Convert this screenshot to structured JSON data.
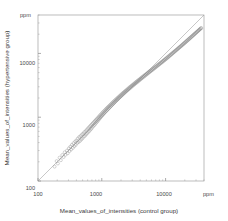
{
  "chart_data": {
    "type": "scatter",
    "title": "",
    "xlabel": "Mean_values_of_intensities (control group)",
    "ylabel": "Mean_values_of_intensities (hypertensive group)",
    "xscale": "log",
    "yscale": "log",
    "xlim": [
      100,
      40000
    ],
    "ylim": [
      100,
      40000
    ],
    "x_tick_labels": [
      "100",
      "1000",
      "10000"
    ],
    "x_tick_values": [
      100,
      1000,
      10000
    ],
    "y_tick_labels": [
      "100",
      "1000",
      "10000"
    ],
    "y_tick_values": [
      100,
      1000,
      10000
    ],
    "x_unit_label": "ppm",
    "y_unit_label": "ppm",
    "grid": false,
    "legend": "none",
    "marker": "open-circle",
    "marker_color": "#8c8c8c",
    "reference_line": {
      "name": "identity-line",
      "type": "y=x",
      "color": "#9a9a9a",
      "from": [
        100,
        100
      ],
      "to": [
        40000,
        40000
      ]
    },
    "series": [
      {
        "name": "genes",
        "points": [
          [
            182,
            168
          ],
          [
            196,
            205
          ],
          [
            205,
            188
          ],
          [
            218,
            232
          ],
          [
            228,
            212
          ],
          [
            240,
            255
          ],
          [
            252,
            238
          ],
          [
            262,
            282
          ],
          [
            270,
            258
          ],
          [
            285,
            300
          ],
          [
            292,
            272
          ],
          [
            305,
            325
          ],
          [
            312,
            295
          ],
          [
            322,
            345
          ],
          [
            330,
            312
          ],
          [
            340,
            368
          ],
          [
            352,
            330
          ],
          [
            360,
            392
          ],
          [
            372,
            352
          ],
          [
            382,
            415
          ],
          [
            390,
            368
          ],
          [
            400,
            432
          ],
          [
            412,
            395
          ],
          [
            420,
            462
          ],
          [
            432,
            408
          ],
          [
            442,
            488
          ],
          [
            455,
            425
          ],
          [
            465,
            508
          ],
          [
            478,
            448
          ],
          [
            488,
            535
          ],
          [
            498,
            468
          ],
          [
            510,
            552
          ],
          [
            522,
            495
          ],
          [
            532,
            582
          ],
          [
            545,
            512
          ],
          [
            558,
            605
          ],
          [
            568,
            538
          ],
          [
            580,
            632
          ],
          [
            592,
            562
          ],
          [
            605,
            665
          ],
          [
            618,
            588
          ],
          [
            630,
            692
          ],
          [
            642,
            615
          ],
          [
            655,
            722
          ],
          [
            668,
            645
          ],
          [
            680,
            752
          ],
          [
            692,
            668
          ],
          [
            705,
            782
          ],
          [
            718,
            705
          ],
          [
            730,
            812
          ],
          [
            745,
            735
          ],
          [
            758,
            845
          ],
          [
            772,
            762
          ],
          [
            785,
            878
          ],
          [
            798,
            798
          ],
          [
            812,
            912
          ],
          [
            825,
            832
          ],
          [
            840,
            945
          ],
          [
            855,
            862
          ],
          [
            870,
            982
          ],
          [
            885,
            902
          ],
          [
            900,
            1015
          ],
          [
            915,
            942
          ],
          [
            930,
            1058
          ],
          [
            945,
            978
          ],
          [
            962,
            1095
          ],
          [
            978,
            1018
          ],
          [
            995,
            1135
          ],
          [
            1010,
            1058
          ],
          [
            1028,
            1178
          ],
          [
            1045,
            1098
          ],
          [
            1062,
            1218
          ],
          [
            1080,
            1142
          ],
          [
            1098,
            1262
          ],
          [
            1115,
            1185
          ],
          [
            1135,
            1305
          ],
          [
            1152,
            1228
          ],
          [
            1172,
            1352
          ],
          [
            1192,
            1272
          ],
          [
            1212,
            1398
          ],
          [
            1232,
            1318
          ],
          [
            1252,
            1445
          ],
          [
            1275,
            1368
          ],
          [
            1295,
            1492
          ],
          [
            1318,
            1415
          ],
          [
            1340,
            1542
          ],
          [
            1362,
            1465
          ],
          [
            1385,
            1592
          ],
          [
            1408,
            1518
          ],
          [
            1432,
            1645
          ],
          [
            1458,
            1572
          ],
          [
            1482,
            1698
          ],
          [
            1508,
            1628
          ],
          [
            1532,
            1755
          ],
          [
            1558,
            1682
          ],
          [
            1585,
            1812
          ],
          [
            1612,
            1742
          ],
          [
            1640,
            1872
          ],
          [
            1668,
            1802
          ],
          [
            1698,
            1932
          ],
          [
            1728,
            1862
          ],
          [
            1758,
            1998
          ],
          [
            1788,
            1925
          ],
          [
            1820,
            2062
          ],
          [
            1852,
            1992
          ],
          [
            1885,
            2128
          ],
          [
            1918,
            2058
          ],
          [
            1952,
            2198
          ],
          [
            1988,
            2128
          ],
          [
            2022,
            2268
          ],
          [
            2058,
            2198
          ],
          [
            2095,
            2342
          ],
          [
            2132,
            2272
          ],
          [
            2172,
            2415
          ],
          [
            2210,
            2348
          ],
          [
            2250,
            2492
          ],
          [
            2292,
            2422
          ],
          [
            2332,
            2572
          ],
          [
            2375,
            2502
          ],
          [
            2418,
            2652
          ],
          [
            2462,
            2582
          ],
          [
            2508,
            2738
          ],
          [
            2552,
            2665
          ],
          [
            2600,
            2822
          ],
          [
            2648,
            2752
          ],
          [
            2698,
            2912
          ],
          [
            2748,
            2838
          ],
          [
            2798,
            3002
          ],
          [
            2852,
            2932
          ],
          [
            2905,
            3095
          ],
          [
            2958,
            3022
          ],
          [
            3015,
            3192
          ],
          [
            3072,
            3118
          ],
          [
            3130,
            3292
          ],
          [
            3188,
            3215
          ],
          [
            3248,
            3392
          ],
          [
            3310,
            3318
          ],
          [
            3372,
            3498
          ],
          [
            3435,
            3422
          ],
          [
            3500,
            3605
          ],
          [
            3568,
            3532
          ],
          [
            3635,
            3718
          ],
          [
            3705,
            3642
          ],
          [
            3775,
            3832
          ],
          [
            3848,
            3758
          ],
          [
            3920,
            3948
          ],
          [
            3995,
            3878
          ],
          [
            4072,
            4072
          ],
          [
            4150,
            3998
          ],
          [
            4230,
            4198
          ],
          [
            4312,
            4122
          ],
          [
            4395,
            4328
          ],
          [
            4480,
            4255
          ],
          [
            4568,
            4462
          ],
          [
            4655,
            4385
          ],
          [
            4748,
            4602
          ],
          [
            4840,
            4525
          ],
          [
            4935,
            4745
          ],
          [
            5032,
            4668
          ],
          [
            5132,
            4892
          ],
          [
            5232,
            4815
          ],
          [
            5338,
            5045
          ],
          [
            5442,
            4968
          ],
          [
            5552,
            5202
          ],
          [
            5662,
            5125
          ],
          [
            5778,
            5365
          ],
          [
            5892,
            5288
          ],
          [
            6012,
            5535
          ],
          [
            6132,
            5455
          ],
          [
            6258,
            5712
          ],
          [
            6382,
            5632
          ],
          [
            6515,
            5892
          ],
          [
            6645,
            5815
          ],
          [
            6782,
            6078
          ],
          [
            6920,
            6002
          ],
          [
            7062,
            6272
          ],
          [
            7205,
            6198
          ],
          [
            7355,
            6472
          ],
          [
            7502,
            6398
          ],
          [
            7658,
            6678
          ],
          [
            7812,
            6605
          ],
          [
            7975,
            6892
          ],
          [
            8135,
            6822
          ],
          [
            8305,
            7115
          ],
          [
            8472,
            7048
          ],
          [
            8648,
            7345
          ],
          [
            8822,
            7282
          ],
          [
            9005,
            7585
          ],
          [
            9185,
            7525
          ],
          [
            9378,
            7835
          ],
          [
            9565,
            7778
          ],
          [
            9765,
            8095
          ],
          [
            9962,
            8042
          ],
          [
            10170,
            8365
          ],
          [
            10375,
            8318
          ],
          [
            10592,
            8648
          ],
          [
            10805,
            8602
          ],
          [
            11030,
            8942
          ],
          [
            11252,
            8902
          ],
          [
            11485,
            9248
          ],
          [
            11718,
            9212
          ],
          [
            11962,
            9565
          ],
          [
            12202,
            9532
          ],
          [
            12455,
            9895
          ],
          [
            12705,
            9868
          ],
          [
            12968,
            10235
          ],
          [
            13228,
            10215
          ],
          [
            13502,
            10588
          ],
          [
            13772,
            10572
          ],
          [
            14058,
            10952
          ],
          [
            14338,
            10945
          ],
          [
            14635,
            11332
          ],
          [
            14925,
            11328
          ],
          [
            15232,
            11725
          ],
          [
            15535,
            11728
          ],
          [
            15855,
            12128
          ],
          [
            16168,
            12138
          ],
          [
            16500,
            12548
          ],
          [
            16825,
            12562
          ],
          [
            17168,
            12982
          ],
          [
            17505,
            13002
          ],
          [
            17862,
            13432
          ],
          [
            18212,
            13458
          ],
          [
            18582,
            13898
          ],
          [
            18945,
            13932
          ],
          [
            19328,
            14382
          ],
          [
            19702,
            14422
          ],
          [
            20098,
            14882
          ],
          [
            20485,
            14928
          ],
          [
            20898,
            15398
          ],
          [
            21302,
            15452
          ],
          [
            21728,
            15932
          ],
          [
            22145,
            15992
          ],
          [
            22588,
            16485
          ],
          [
            23022,
            16552
          ],
          [
            23482,
            17055
          ],
          [
            23932,
            17132
          ],
          [
            24408,
            17648
          ],
          [
            24875,
            17732
          ],
          [
            25368,
            18262
          ],
          [
            25852,
            18352
          ],
          [
            26362,
            18898
          ],
          [
            26865,
            18995
          ],
          [
            27395,
            19555
          ],
          [
            27912,
            19662
          ],
          [
            28462,
            20235
          ],
          [
            29000,
            20352
          ],
          [
            29568,
            20938
          ],
          [
            30125,
            21062
          ],
          [
            30712,
            21665
          ],
          [
            31288,
            21798
          ],
          [
            31895,
            22415
          ],
          [
            32492,
            22558
          ],
          [
            33118,
            23192
          ],
          [
            33732,
            23342
          ],
          [
            34382,
            23995
          ],
          [
            35018,
            24155
          ],
          [
            35688,
            24825
          ],
          [
            36345,
            24995
          ]
        ]
      }
    ],
    "n_points": 250,
    "correlation_note": "points distributed tightly along identity line"
  },
  "labels": {
    "x_axis_title": "Mean_values_of_intensities (control group)",
    "y_axis_title": "Mean_values_of_intensities (hypertensive group)",
    "top_left_unit": "ppm",
    "bottom_right_unit": "ppm",
    "y_tick_100": "100",
    "y_tick_1000": "1000",
    "y_tick_10000": "10000",
    "x_tick_100": "100",
    "x_tick_1000": "1000",
    "x_tick_10000": "10000"
  },
  "colors": {
    "frame": "#9a9a9a",
    "marker": "#8c8c8c",
    "line": "#9a9a9a",
    "text": "#444444",
    "background": "#ffffff"
  }
}
